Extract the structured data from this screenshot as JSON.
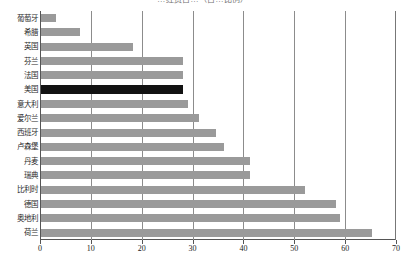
{
  "chart_data": {
    "type": "bar",
    "orientation": "horizontal",
    "title": "…经费占…（占…比例）",
    "xlabel": "",
    "ylabel": "",
    "xlim": [
      0,
      70
    ],
    "xticks": [
      0,
      10,
      20,
      30,
      40,
      50,
      60,
      70
    ],
    "grid": "vertical",
    "legend": "none",
    "categories": [
      "葡萄牙",
      "希腊",
      "英国",
      "芬兰",
      "法国",
      "美国",
      "意大利",
      "爱尔兰",
      "西班牙",
      "卢森堡",
      "丹麦",
      "瑞典",
      "比利时",
      "德国",
      "奥地利",
      "荷兰"
    ],
    "values": [
      3,
      7.7,
      18,
      28,
      28,
      28,
      29,
      31,
      34.5,
      36,
      41,
      41,
      52,
      58,
      58.7,
      65
    ],
    "highlight_category": "美国",
    "colors": {
      "bar": "#9a9a9a",
      "highlight_bar": "#121212",
      "gridline": "#8c8c8c",
      "axis": "#555555",
      "background": "#ffffff",
      "text": "#1a1a1a"
    }
  }
}
